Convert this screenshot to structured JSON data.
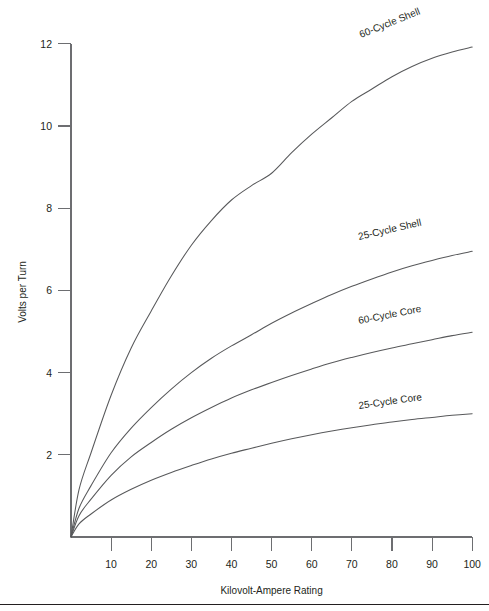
{
  "chart_data": {
    "type": "line",
    "title": "",
    "xlabel": "Kilovolt-Ampere Rating",
    "ylabel": "Volts per Turn",
    "xlim": [
      0,
      100
    ],
    "ylim": [
      0,
      12.6
    ],
    "xticks": [
      10,
      20,
      30,
      40,
      50,
      60,
      70,
      80,
      90,
      100
    ],
    "yticks": [
      2,
      4,
      6,
      8,
      10,
      12
    ],
    "xtick_labels": [
      "10",
      "20",
      "30",
      "40",
      "50",
      "60",
      "70",
      "80",
      "90",
      "100"
    ],
    "ytick_labels": [
      "2",
      "4",
      "6",
      "8",
      "10",
      "12"
    ],
    "grid": false,
    "legend": "inline-curve-labels",
    "x": [
      0,
      2,
      5,
      10,
      15,
      20,
      25,
      30,
      35,
      40,
      45,
      50,
      55,
      60,
      65,
      70,
      75,
      80,
      85,
      90,
      95,
      100
    ],
    "series": [
      {
        "name": "60-Cycle Shell",
        "label": "60-Cycle Shell",
        "label_rotation_deg": -22,
        "values": [
          0,
          1.15,
          2.05,
          3.45,
          4.6,
          5.5,
          6.35,
          7.1,
          7.7,
          8.2,
          8.55,
          8.85,
          9.35,
          9.8,
          10.2,
          10.6,
          10.9,
          11.2,
          11.45,
          11.65,
          11.8,
          11.92
        ]
      },
      {
        "name": "25-Cycle Shell",
        "label": "25-Cycle Shell",
        "label_rotation_deg": -13,
        "values": [
          0,
          0.7,
          1.25,
          2.05,
          2.65,
          3.15,
          3.6,
          4.0,
          4.35,
          4.65,
          4.92,
          5.2,
          5.45,
          5.68,
          5.9,
          6.1,
          6.28,
          6.45,
          6.6,
          6.73,
          6.85,
          6.95
        ]
      },
      {
        "name": "60-Cycle Core",
        "label": "60-Cycle Core",
        "label_rotation_deg": -11,
        "values": [
          0,
          0.52,
          0.92,
          1.5,
          1.95,
          2.3,
          2.62,
          2.9,
          3.15,
          3.38,
          3.58,
          3.76,
          3.93,
          4.09,
          4.24,
          4.37,
          4.49,
          4.6,
          4.7,
          4.8,
          4.9,
          4.98
        ]
      },
      {
        "name": "25-Cycle Core",
        "label": "25-Cycle Core",
        "label_rotation_deg": -8,
        "values": [
          0,
          0.32,
          0.56,
          0.9,
          1.16,
          1.38,
          1.57,
          1.74,
          1.9,
          2.04,
          2.16,
          2.28,
          2.39,
          2.49,
          2.58,
          2.66,
          2.73,
          2.8,
          2.86,
          2.91,
          2.96,
          3.0
        ]
      }
    ],
    "label_positions": [
      {
        "name": "60-Cycle Shell",
        "x": 361,
        "y": 38
      },
      {
        "name": "25-Cycle Shell",
        "x": 359,
        "y": 240
      },
      {
        "name": "60-Cycle Core",
        "x": 359,
        "y": 324
      },
      {
        "name": "25-Cycle Core",
        "x": 359,
        "y": 409
      }
    ],
    "colors": {
      "curve": "#58595b",
      "axis": "#6d6e71",
      "text": "#231f20",
      "background": "#ffffff"
    }
  }
}
